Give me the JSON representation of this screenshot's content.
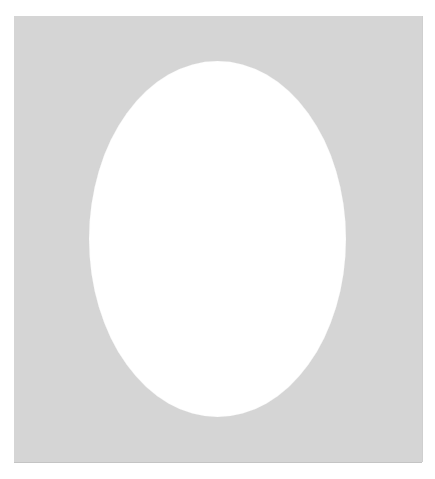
{
  "image": {
    "subject": "Gray picture-frame mat with oval opening",
    "colors": {
      "background": "#ffffff",
      "mat": "#d5d5d5",
      "opening": "#ffffff"
    },
    "shapes": {
      "mat": {
        "x": 14,
        "y": 16,
        "width": 408,
        "height": 446
      },
      "oval_opening": {
        "x": 89,
        "y": 61,
        "width": 257,
        "height": 356
      }
    }
  }
}
